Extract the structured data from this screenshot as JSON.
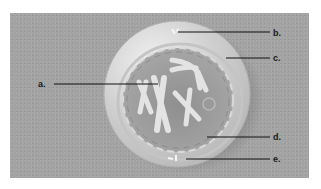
{
  "diagram": {
    "background_color": "#a3a3a3",
    "labels": [
      {
        "id": "a",
        "text": "a."
      },
      {
        "id": "b",
        "text": "b."
      },
      {
        "id": "c",
        "text": "c."
      },
      {
        "id": "d",
        "text": "d."
      },
      {
        "id": "e",
        "text": "e."
      }
    ],
    "parts": [
      "cell-membrane",
      "cytoplasm",
      "nuclear-envelope",
      "chromosomes",
      "nucleolus",
      "centrioles"
    ]
  }
}
